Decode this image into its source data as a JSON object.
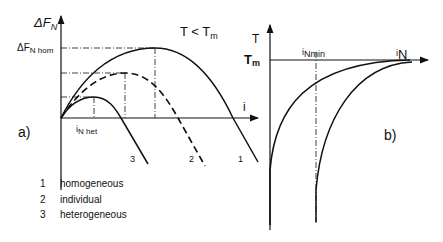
{
  "panel_a": {
    "label": "a)",
    "y_axis_label": "ΔF",
    "y_axis_label_sub": "N",
    "x_axis_label": "i",
    "condition": "T < T",
    "condition_sub": "m",
    "y_marker_label": "ΔF",
    "y_marker_sub": "N hom",
    "x_marker_label": "i",
    "x_marker_sub": "N het",
    "curves": [
      {
        "id": "1",
        "name": "homogeneous",
        "style": "solid"
      },
      {
        "id": "2",
        "name": "individual",
        "style": "dashed"
      },
      {
        "id": "3",
        "name": "heterogeneous",
        "style": "solid"
      }
    ]
  },
  "panel_b": {
    "label": "b)",
    "y_axis_label": "T",
    "tm_label": "T",
    "tm_sub": "m",
    "x_marker_label": "i",
    "x_marker_sub": "Nmin",
    "x_axis_label": "i",
    "x_axis_sub": "N"
  },
  "legend": [
    {
      "num": "1",
      "text": "homogeneous"
    },
    {
      "num": "2",
      "text": "individual"
    },
    {
      "num": "3",
      "text": "heterogeneous"
    }
  ]
}
